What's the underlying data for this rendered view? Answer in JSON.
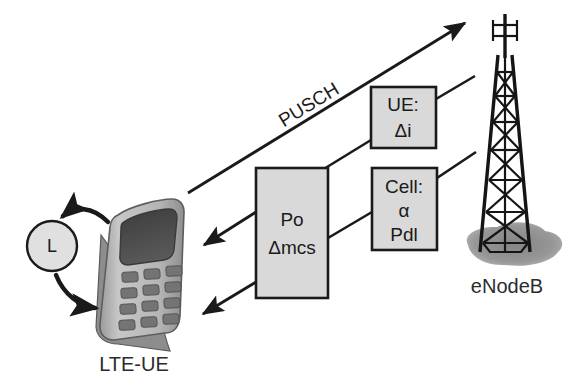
{
  "diagram": {
    "nodes": {
      "ue_label": "LTE-UE",
      "enodeb_label": "eNodeB",
      "loop_circle_label": "L"
    },
    "channel": {
      "pusch_label": "PUSCH"
    },
    "boxes": [
      {
        "id": "po-box",
        "lines": [
          "Po",
          "Δmcs"
        ]
      },
      {
        "id": "ue-params-box",
        "lines": [
          "UE:",
          "Δi"
        ]
      },
      {
        "id": "cell-params-box",
        "lines": [
          "Cell:",
          "α",
          "Pdl"
        ]
      }
    ],
    "colors": {
      "box_fill": "#d9d9d9",
      "box_stroke": "#1a1a1a",
      "line": "#1a1a1a",
      "shadow": "#8c8c8c",
      "phone_body": "#b3b3b3",
      "phone_screen": "#4a4a4a",
      "background": "#ffffff"
    }
  }
}
